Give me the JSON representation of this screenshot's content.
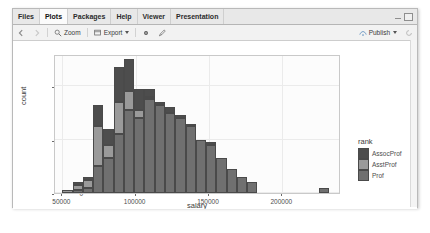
{
  "window": {
    "tabs": [
      {
        "label": "Files",
        "active": false
      },
      {
        "label": "Plots",
        "active": true
      },
      {
        "label": "Packages",
        "active": false
      },
      {
        "label": "Help",
        "active": false
      },
      {
        "label": "Viewer",
        "active": false
      },
      {
        "label": "Presentation",
        "active": false
      }
    ],
    "controls": {
      "minimize": "minimize-icon",
      "maximize": "maximize-icon"
    }
  },
  "toolbar": {
    "back_icon": "back-arrow-icon",
    "forward_icon": "forward-arrow-icon",
    "zoom_label": "Zoom",
    "zoom_icon": "magnifier-icon",
    "export_label": "Export",
    "export_icon": "export-icon",
    "remove_icon": "gear-icon",
    "clear_icon": "brush-icon",
    "publish_label": "Publish",
    "publish_icon": "publish-icon"
  },
  "chart_data": {
    "type": "bar",
    "subtype": "stacked-histogram",
    "title": "",
    "xlabel": "salary",
    "ylabel": "count",
    "xlim": [
      45000,
      240000
    ],
    "ylim": [
      0,
      52
    ],
    "xticks": [
      "50000",
      "100000",
      "150000",
      "200000"
    ],
    "xtick_values": [
      50000,
      100000,
      150000,
      200000
    ],
    "yticks": [
      "0",
      "20",
      "40"
    ],
    "ytick_values": [
      0,
      20,
      40
    ],
    "grid": true,
    "legend": {
      "title": "rank",
      "position": "right",
      "entries": [
        {
          "label": "AssocProf",
          "color": "#4d4d4d"
        },
        {
          "label": "AsstProf",
          "color": "#9a9a9a"
        },
        {
          "label": "Prof",
          "color": "#707070"
        }
      ]
    },
    "series": [
      {
        "name": "Prof",
        "color": "#707070",
        "values": [
          0,
          1,
          2,
          10,
          13,
          22,
          31,
          28,
          35,
          33,
          30,
          28,
          25,
          20,
          18,
          13,
          9,
          6,
          4,
          0,
          2
        ]
      },
      {
        "name": "AsstProf",
        "color": "#9a9a9a",
        "values": [
          1,
          2,
          3,
          15,
          5,
          12,
          7,
          3,
          1,
          0,
          0,
          0,
          0,
          0,
          0,
          0,
          0,
          0,
          0,
          0,
          0
        ]
      },
      {
        "name": "AssocProf",
        "color": "#4d4d4d",
        "values": [
          0,
          1,
          1,
          8,
          6,
          13,
          12,
          8,
          3,
          1,
          2,
          1,
          1,
          0,
          1,
          0,
          0,
          0,
          0,
          0,
          0
        ]
      }
    ],
    "bin_starts": [
      50000,
      57000,
      64000,
      71000,
      78000,
      85000,
      92000,
      99000,
      106000,
      113000,
      120000,
      127000,
      134000,
      141000,
      148000,
      155000,
      162000,
      169000,
      176000,
      183000,
      225000
    ],
    "bin_width": 7000,
    "totals": [
      1,
      4,
      6,
      33,
      24,
      47,
      50,
      39,
      39,
      34,
      32,
      29,
      26,
      20,
      19,
      13,
      9,
      6,
      4,
      0,
      2
    ]
  }
}
